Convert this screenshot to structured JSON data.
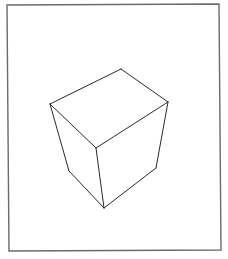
{
  "diagram": {
    "title": "",
    "colors": {
      "background": "#ffffff",
      "frame": "#6b6b6b",
      "edges": "#2a2a2a"
    },
    "frame": {
      "points": [
        [
          7,
          5
        ],
        [
          219,
          4
        ],
        [
          221,
          250
        ],
        [
          9,
          251
        ]
      ]
    },
    "cube": {
      "vertices": {
        "top_back": [
          121,
          69
        ],
        "top_left": [
          50,
          104
        ],
        "top_right": [
          168,
          102
        ],
        "top_front": [
          96,
          148
        ],
        "bottom_left": [
          69,
          171
        ],
        "bottom_right": [
          156,
          168
        ],
        "bottom_front": [
          104,
          208
        ]
      },
      "edges": [
        [
          "top_back",
          "top_left"
        ],
        [
          "top_back",
          "top_right"
        ],
        [
          "top_left",
          "top_front"
        ],
        [
          "top_right",
          "top_front"
        ],
        [
          "top_left",
          "bottom_left"
        ],
        [
          "top_right",
          "bottom_right"
        ],
        [
          "top_front",
          "bottom_front"
        ],
        [
          "bottom_left",
          "bottom_front"
        ],
        [
          "bottom_right",
          "bottom_front"
        ]
      ]
    }
  }
}
